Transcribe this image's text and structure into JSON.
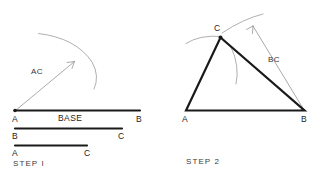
{
  "canvas": {
    "width": 329,
    "height": 174,
    "background": "#ffffff",
    "ink": "#1a1a1a",
    "light_ink": "#9a9a9a"
  },
  "steps": [
    {
      "id": "step-1",
      "caption": "STEP I",
      "labels": {
        "arc_radius": "AC",
        "base": "BASE",
        "base_start": "A",
        "base_end": "B",
        "seg_bc_start": "B",
        "seg_bc_end": "C",
        "seg_ac_start": "A",
        "seg_ac_end": "C"
      }
    },
    {
      "id": "step-2",
      "caption": "STEP 2",
      "labels": {
        "vertex_a": "A",
        "vertex_b": "B",
        "vertex_c": "C",
        "arc_radius": "BC"
      }
    }
  ]
}
